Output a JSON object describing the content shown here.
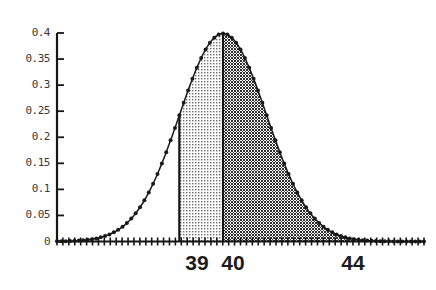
{
  "chart_data": {
    "type": "area",
    "title": "",
    "subtitle": "",
    "xlabel": "",
    "ylabel": "",
    "grid": false,
    "legend": "none",
    "distribution": {
      "name": "normal",
      "mean": 40,
      "sigma": 1,
      "peak_density": 0.4
    },
    "xlim": [
      36.2,
      44.6
    ],
    "ylim": [
      0,
      0.4
    ],
    "x_ticks": [
      39,
      40,
      44
    ],
    "x_tick_labels": [
      "39",
      "40",
      "44"
    ],
    "y_ticks": [
      0,
      0.05,
      0.1,
      0.15,
      0.2,
      0.25,
      0.3,
      0.35,
      0.4
    ],
    "y_tick_labels": [
      "0",
      "0.05",
      "0.1",
      "0.15",
      "0.2",
      "0.25",
      "0.3",
      "0.35",
      "0.4"
    ],
    "shaded_regions": [
      {
        "name": "light-region-39-40",
        "x_start": 39,
        "x_end": 40,
        "fill_style": "light-dotted",
        "fill_color": "#b4b4b4",
        "area": 0.3413
      },
      {
        "name": "dark-region-40-44",
        "x_start": 40,
        "x_end": 44,
        "fill_style": "dark-checkered",
        "fill_color": "#4a4a4a",
        "area": 0.49997
      }
    ],
    "series": [
      {
        "name": "normal-density-curve",
        "marker": "dot",
        "color": "#1a1a1a",
        "x": [
          36.2,
          36.4,
          36.6,
          36.8,
          37.0,
          37.2,
          37.4,
          37.6,
          37.8,
          38.0,
          38.2,
          38.4,
          38.6,
          38.8,
          39.0,
          39.2,
          39.4,
          39.6,
          39.8,
          40.0,
          40.2,
          40.4,
          40.6,
          40.8,
          41.0,
          41.2,
          41.4,
          41.6,
          41.8,
          42.0,
          42.2,
          42.4,
          42.6,
          42.8,
          43.0,
          43.2,
          43.4,
          43.6,
          43.8,
          44.0,
          44.2,
          44.4,
          44.6
        ],
        "values": [
          0.004,
          0.007,
          0.012,
          0.019,
          0.03,
          0.044,
          0.063,
          0.086,
          0.115,
          0.148,
          0.184,
          0.222,
          0.261,
          0.298,
          0.33,
          0.356,
          0.375,
          0.386,
          0.391,
          0.399,
          0.391,
          0.386,
          0.375,
          0.356,
          0.33,
          0.298,
          0.261,
          0.222,
          0.184,
          0.148,
          0.115,
          0.086,
          0.063,
          0.044,
          0.03,
          0.019,
          0.012,
          0.007,
          0.005,
          0.004,
          0.003,
          0.002,
          0.002
        ]
      }
    ]
  },
  "axes": {
    "y_axis_name": "y-axis",
    "x_axis_name": "x-axis",
    "baseline_value": "0"
  }
}
